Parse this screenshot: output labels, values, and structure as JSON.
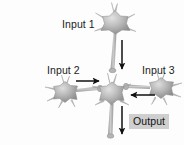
{
  "diagram": {
    "background_color": "#fdfdfd",
    "labels": {
      "input1": "Input 1",
      "input2": "Input 2",
      "input3": "Input 3",
      "output": "Output"
    },
    "output_label_background": "#cfcfcf",
    "text_color": "#1b1b1b",
    "neuron_color_light": "#d8d8d8",
    "neuron_color_mid": "#a8a8a8",
    "neuron_color_dark": "#7d7d7d",
    "arrow_color": "#111111",
    "neurons": [
      {
        "name": "input-1-neuron",
        "cx": 115,
        "cy": 22,
        "r": 14,
        "axon_direction": "down"
      },
      {
        "name": "input-2-neuron",
        "cx": 65,
        "cy": 92,
        "r": 13,
        "axon_direction": "right"
      },
      {
        "name": "input-3-neuron",
        "cx": 161,
        "cy": 89,
        "r": 13,
        "axon_direction": "left"
      },
      {
        "name": "central-neuron",
        "cx": 112,
        "cy": 95,
        "r": 13,
        "axon_direction": "down"
      }
    ],
    "arrows": [
      {
        "name": "arrow-input1-to-center",
        "direction": "down",
        "x1": 122,
        "y1": 40,
        "x2": 122,
        "y2": 70
      },
      {
        "name": "arrow-input2-to-center",
        "direction": "right",
        "x1": 76,
        "y1": 81,
        "x2": 100,
        "y2": 81
      },
      {
        "name": "arrow-input3-to-center",
        "direction": "left",
        "x1": 155,
        "y1": 95,
        "x2": 130,
        "y2": 95
      },
      {
        "name": "arrow-center-to-output",
        "direction": "down",
        "x1": 122,
        "y1": 105,
        "x2": 122,
        "y2": 135
      }
    ]
  }
}
